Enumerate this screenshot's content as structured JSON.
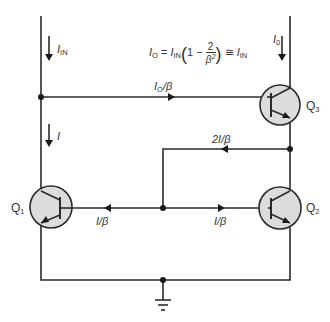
{
  "diagram": {
    "type": "circuit-schematic",
    "equation": {
      "lhs": "I",
      "lhs_sub": "O",
      "eq": "=",
      "in": "I",
      "in_sub": "IN",
      "one_minus": "1 −",
      "frac_num": "2",
      "frac_den": "β",
      "frac_den_sup": "2",
      "approx": "≅",
      "rhs": "I",
      "rhs_sub": "IN"
    },
    "labels": {
      "iin": {
        "main": "I",
        "sub": "IN"
      },
      "io": {
        "main": "I",
        "sub": "0"
      },
      "i_left": {
        "main": "I"
      },
      "io_beta": {
        "main": "I",
        "sub": "O",
        "tail": "/β"
      },
      "two_i_beta": "2I/β",
      "i_beta_left": "I/β",
      "i_beta_right": "I/β"
    },
    "transistors": [
      {
        "id": "Q1",
        "name": "Q",
        "sub": "1"
      },
      {
        "id": "Q2",
        "name": "Q",
        "sub": "2"
      },
      {
        "id": "Q3",
        "name": "Q",
        "sub": "3"
      }
    ],
    "symbols": {
      "ground": "ground-icon",
      "node": "junction-dot",
      "arrow": "current-direction-arrow"
    },
    "colors": {
      "wire": "#2a2a2a",
      "transistor_fill": "#dcdcdc",
      "text": "#333333"
    }
  }
}
